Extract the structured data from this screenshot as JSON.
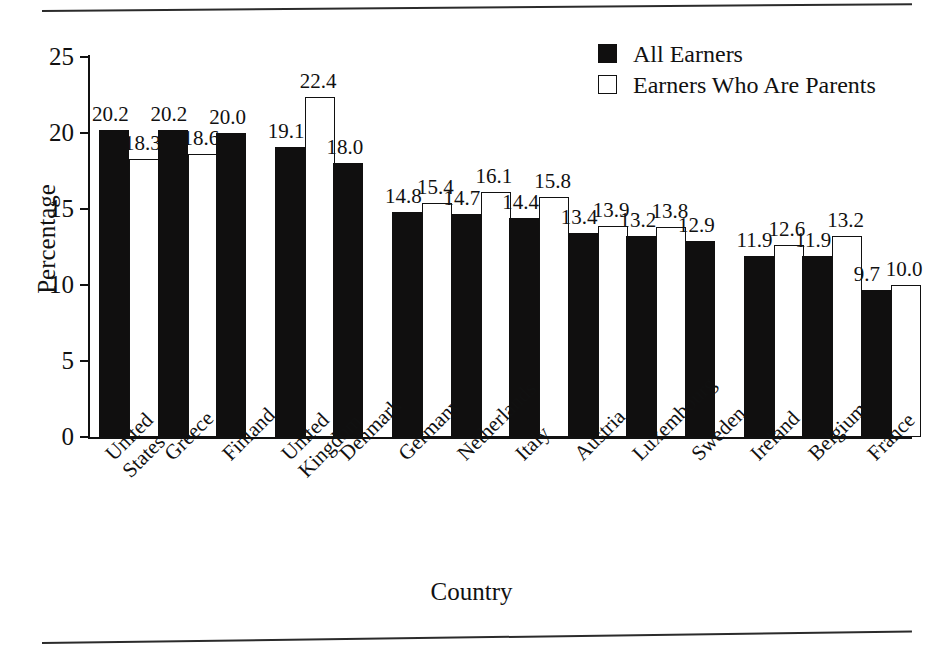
{
  "rules": {
    "top": "horizontal-rule",
    "bottom": "horizontal-rule"
  },
  "legend": {
    "position": "top-right",
    "entries": [
      {
        "label": "All Earners",
        "swatch": "filled-square",
        "color": "#100f0f"
      },
      {
        "label": "Earners Who Are Parents",
        "swatch": "hollow-square",
        "color": "#ffffff"
      }
    ]
  },
  "axes": {
    "y_title": "Percentage",
    "x_title": "Country",
    "y_ticks": [
      "0",
      "5",
      "10",
      "15",
      "20",
      "25"
    ]
  },
  "chart_data": {
    "type": "bar",
    "title": "",
    "xlabel": "Country",
    "ylabel": "Percentage",
    "ylim": [
      0,
      25
    ],
    "yticks": [
      0,
      5,
      10,
      15,
      20,
      25
    ],
    "grid": false,
    "legend_position": "top-right",
    "categories": [
      "United\nStates",
      "Greece",
      "Finland",
      "United\nKingdom",
      "Denmark",
      "Germany",
      "Netherlands",
      "Italy",
      "Austria",
      "Luxembourg",
      "Sweden",
      "Ireland",
      "Belgium",
      "France"
    ],
    "series": [
      {
        "name": "All Earners",
        "style": "filled",
        "values": [
          20.2,
          20.2,
          20.0,
          19.1,
          18.0,
          14.8,
          14.7,
          14.4,
          13.4,
          13.2,
          12.9,
          11.9,
          11.9,
          9.7
        ]
      },
      {
        "name": "Earners Who Are Parents",
        "style": "hollow",
        "values": [
          18.3,
          18.6,
          null,
          22.4,
          null,
          15.4,
          16.1,
          15.8,
          13.9,
          13.8,
          null,
          12.6,
          13.2,
          10.0
        ]
      }
    ],
    "labels": {
      "All Earners": [
        "20.2",
        "20.2",
        "20.0",
        "19.1",
        "18.0",
        "14.8",
        "14.7",
        "14.4",
        "13.4",
        "13.2",
        "12.9",
        "11.9",
        "11.9",
        "9.7"
      ],
      "Earners Who Are Parents": [
        "18.3",
        "18.6",
        "",
        "22.4",
        "",
        "15.4",
        "16.1",
        "15.8",
        "13.9",
        "13.8",
        "",
        "12.6",
        "13.2",
        "10.0"
      ]
    }
  },
  "colors": {
    "filled_bar": "#100f0f",
    "hollow_bar": "#ffffff",
    "axis": "#111111",
    "text": "#111111",
    "background": "#ffffff"
  }
}
